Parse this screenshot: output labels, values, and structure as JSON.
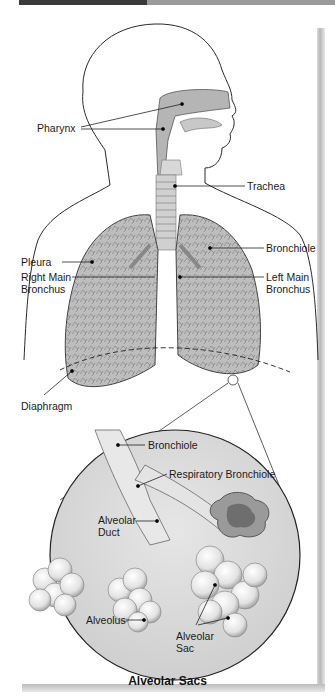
{
  "figure": {
    "caption": "Alveolar Sacs",
    "colors": {
      "outline": "#2a2a2a",
      "tissue_light": "#d6d6d6",
      "tissue_mid": "#b4b4b4",
      "tissue_dark": "#8a8a8a",
      "background": "#ffffff"
    }
  },
  "labels": {
    "pharynx": "Pharynx",
    "trachea": "Trachea",
    "bronchiole_upper": "Bronchiole",
    "pleura": "Pleura",
    "right_main_bronchus_1": "Right Main",
    "right_main_bronchus_2": "Bronchus",
    "left_main_bronchus_1": "Left Main",
    "left_main_bronchus_2": "Bronchus",
    "diaphragm": "Diaphragm",
    "bronchiole_inset": "Bronchiole",
    "respiratory_bronchiole": "Respiratory Bronchiole",
    "alveolar_duct_1": "Alveolar",
    "alveolar_duct_2": "Duct",
    "alveolus": "Alveolus",
    "alveolar_sac_1": "Alveolar",
    "alveolar_sac_2": "Sac"
  }
}
